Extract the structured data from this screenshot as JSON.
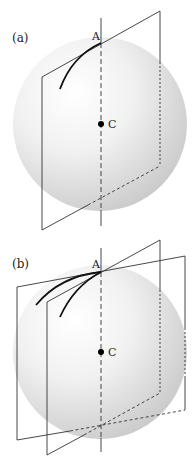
{
  "figure": {
    "colors": {
      "line": "#333333",
      "curve": "#111111",
      "sphere_light": "#ffffff",
      "sphere_dark": "#cccccc"
    },
    "panels": [
      {
        "label": "(a)",
        "point_top": "A",
        "point_center": "C",
        "planes": 1,
        "curves": 1
      },
      {
        "label": "(b)",
        "point_top": "A",
        "point_center": "C",
        "planes": 2,
        "curves": 2
      }
    ]
  }
}
